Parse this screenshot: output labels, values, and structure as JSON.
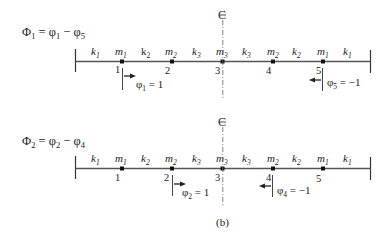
{
  "figure": {
    "caption": "(b)",
    "centerline_symbol": "CL",
    "diagrams": [
      {
        "id": "mode-1",
        "equation": {
          "lhs": "Φ",
          "lhs_sub": "1",
          "rhs_a": "φ",
          "rhs_a_sub": "1",
          "rhs_b": "φ",
          "rhs_b_sub": "5"
        },
        "springs": [
          {
            "k": "k",
            "sub": "1",
            "italic": true
          },
          {
            "k": "k",
            "sub": "2",
            "italic": false
          },
          {
            "k": "k",
            "sub": "3",
            "italic": true
          },
          {
            "k": "k",
            "sub": "3",
            "italic": true
          },
          {
            "k": "k",
            "sub": "2",
            "italic": true
          },
          {
            "k": "k",
            "sub": "1",
            "italic": true
          }
        ],
        "masses": [
          {
            "m": "m",
            "sub": "1",
            "node": "1"
          },
          {
            "m": "m",
            "sub": "2",
            "node": "2"
          },
          {
            "m": "m",
            "sub": "3",
            "node": "3"
          },
          {
            "m": "m",
            "sub": "2",
            "node": "4"
          },
          {
            "m": "m",
            "sub": "1",
            "node": "5"
          }
        ],
        "displacements": [
          {
            "node_index": 0,
            "symbol": "φ",
            "sub": "1",
            "value": "1",
            "direction": "right"
          },
          {
            "node_index": 4,
            "symbol": "φ",
            "sub": "5",
            "value": "−1",
            "direction": "left"
          }
        ]
      },
      {
        "id": "mode-2",
        "equation": {
          "lhs": "Φ",
          "lhs_sub": "2",
          "rhs_a": "φ",
          "rhs_a_sub": "2",
          "rhs_b": "φ",
          "rhs_b_sub": "4"
        },
        "springs": [
          {
            "k": "k",
            "sub": "1",
            "italic": true
          },
          {
            "k": "k",
            "sub": "2",
            "italic": true
          },
          {
            "k": "k",
            "sub": "3",
            "italic": true
          },
          {
            "k": "k",
            "sub": "3",
            "italic": true
          },
          {
            "k": "k",
            "sub": "2",
            "italic": true
          },
          {
            "k": "k",
            "sub": "1",
            "italic": true
          }
        ],
        "masses": [
          {
            "m": "m",
            "sub": "1",
            "node": "1"
          },
          {
            "m": "m",
            "sub": "2",
            "node": "2"
          },
          {
            "m": "m",
            "sub": "3",
            "node": "3"
          },
          {
            "m": "m",
            "sub": "2",
            "node": "4"
          },
          {
            "m": "m",
            "sub": "1",
            "node": "5"
          }
        ],
        "displacements": [
          {
            "node_index": 1,
            "symbol": "φ",
            "sub": "2",
            "value": "1",
            "direction": "right"
          },
          {
            "node_index": 3,
            "symbol": "φ",
            "sub": "4",
            "value": "−1",
            "direction": "left"
          }
        ]
      }
    ]
  }
}
